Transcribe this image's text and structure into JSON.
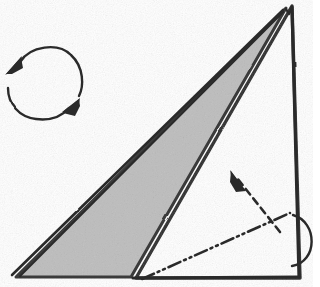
{
  "diagram": {
    "type": "line-drawing",
    "canvas": {
      "width": 320,
      "height": 287,
      "background": "#ffffff"
    },
    "style": {
      "ink_color": "#2b2b2b",
      "paper_shaded_color": "#bdbdbd",
      "paper_white_color": "#ffffff",
      "stroke_width_main": 3.2,
      "stroke_width_thin": 1.6
    },
    "shapes": {
      "outer_triangle": {
        "name": "outer-paper-triangle",
        "fill": "#ffffff",
        "description": "large right triangle, apex top right",
        "points": "292,6 300,278 136,278"
      },
      "shaded_flap": {
        "name": "shaded-flap",
        "fill": "#bdbdbd",
        "description": "narrow shaded triangular flap from apex down to lower left",
        "points": "286,8 131,277 16,277"
      },
      "fold_edge_line": {
        "name": "folded-edge-double-line",
        "description": "second parallel line along hypotenuse showing folded layer",
        "path": "M 283,10 L 12,275"
      }
    },
    "annotations": {
      "rotate_symbol": {
        "name": "rotate-arrow-symbol",
        "meaning": "turn the model over / rotate",
        "center_x": 45,
        "center_y": 82,
        "radius": 38,
        "arrowheads": 2
      },
      "fold_line": {
        "name": "dash-dot-dot-fold-line",
        "meaning": "fold along this line",
        "pattern": "dash-dot-dot",
        "path": "M 142,279 L 290,213"
      },
      "fold_arrow": {
        "name": "dashed-fold-arrow",
        "meaning": "fold direction, arrow points up-left",
        "pattern": "dashed",
        "path": "M 280,232 L 237,178",
        "arrow_tip_x": 232,
        "arrow_tip_y": 172
      },
      "curl_arrow": {
        "name": "curl-loop-arrow",
        "meaning": "roll / wrap edge around to the back",
        "path": "M 293,215 C 318,222 318,262 292,266"
      }
    }
  }
}
